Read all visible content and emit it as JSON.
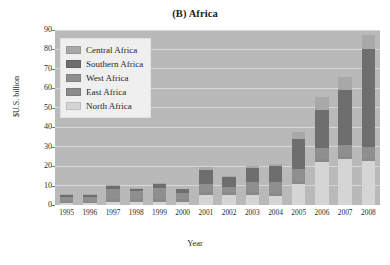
{
  "chart_data": {
    "type": "bar",
    "stacked": true,
    "title": "(B) Africa",
    "xlabel": "Year",
    "ylabel": "$U.S. billion",
    "ylim": [
      0,
      90
    ],
    "ytick_step": 10,
    "yticks": [
      0,
      10,
      20,
      30,
      40,
      50,
      60,
      70,
      80,
      90
    ],
    "grid": true,
    "legend_position": "top-left-inside",
    "categories": [
      "1995",
      "1996",
      "1997",
      "1998",
      "1999",
      "2000",
      "2001",
      "2002",
      "2003",
      "2004",
      "2005",
      "2006",
      "2007",
      "2008"
    ],
    "series": [
      {
        "name": "North Africa",
        "color": "#d5d5d5",
        "values": [
          1.0,
          0.8,
          1.5,
          1.5,
          1.5,
          1.5,
          5.0,
          5.0,
          5.0,
          4.5,
          11.0,
          22.0,
          23.5,
          22.5
        ]
      },
      {
        "name": "East Africa",
        "color": "#8a8a8a",
        "values": [
          1.0,
          1.0,
          1.5,
          1.5,
          1.5,
          1.5,
          1.5,
          1.5,
          1.5,
          1.5,
          1.5,
          1.5,
          1.5,
          1.5
        ]
      },
      {
        "name": "West Africa",
        "color": "#8f8f8f",
        "values": [
          2.0,
          2.2,
          5.0,
          4.0,
          6.0,
          3.0,
          4.5,
          3.0,
          5.5,
          6.0,
          6.0,
          6.0,
          6.0,
          6.0
        ]
      },
      {
        "name": "Southern Africa",
        "color": "#6e6e6e",
        "values": [
          1.0,
          1.0,
          2.0,
          1.5,
          2.0,
          2.0,
          7.0,
          5.0,
          7.0,
          8.0,
          15.5,
          19.5,
          28.0,
          50.0
        ]
      },
      {
        "name": "Central Africa",
        "color": "#a8a8a8",
        "values": [
          0.5,
          0.5,
          0.5,
          0.5,
          0.5,
          0.5,
          1.5,
          0.5,
          1.0,
          1.0,
          3.5,
          6.5,
          7.0,
          7.5
        ]
      }
    ],
    "totals": [
      5.5,
      5.5,
      10.5,
      9.0,
      11.5,
      8.5,
      19.5,
      15.0,
      20.0,
      21.0,
      37.5,
      55.5,
      66.0,
      87.5
    ]
  },
  "legend": {
    "items": [
      {
        "label": "Central Africa"
      },
      {
        "label": "Southern Africa"
      },
      {
        "label": "West Africa"
      },
      {
        "label": "East Africa"
      },
      {
        "label": "North Africa"
      }
    ]
  },
  "colors": {
    "plot_background": "#b9b9b9",
    "gridline": "#d8d8d8",
    "page_background": "#ffffff",
    "text": "#2a2a2a"
  }
}
